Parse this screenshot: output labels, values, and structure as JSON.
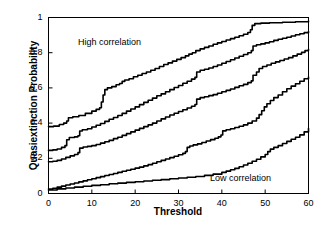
{
  "chart_data": {
    "type": "line",
    "title": "",
    "xlabel": "Threshold",
    "ylabel": "Quasiextinction Probability",
    "xlim": [
      0,
      60
    ],
    "ylim": [
      0,
      1
    ],
    "grid": false,
    "legend": "none",
    "xticks": [
      0,
      10,
      20,
      30,
      40,
      50,
      60
    ],
    "xtick_labels": [
      "0",
      "10",
      "20",
      "30",
      "40",
      "50",
      "60"
    ],
    "yticks": [
      0,
      0.2,
      0.4,
      0.6,
      0.8,
      1
    ],
    "ytick_labels": [
      "0",
      "0.2",
      "0.4",
      "0.6",
      "0.8",
      "1"
    ],
    "annotations": [
      {
        "text": "High correlation",
        "x": 10,
        "y": 0.88
      },
      {
        "text": "Low correlation",
        "x": 40,
        "y": 0.12
      }
    ],
    "line_color": "#000000",
    "line_width": 1.6,
    "series": [
      {
        "name": "curve-1",
        "points": [
          [
            0,
            0.38
          ],
          [
            1.2,
            0.383
          ],
          [
            2.5,
            0.392
          ],
          [
            3.5,
            0.4
          ],
          [
            4.2,
            0.412
          ],
          [
            4.6,
            0.43
          ],
          [
            5.6,
            0.436
          ],
          [
            7.0,
            0.443
          ],
          [
            8.5,
            0.455
          ],
          [
            10.0,
            0.468
          ],
          [
            11.0,
            0.478
          ],
          [
            11.8,
            0.487
          ],
          [
            12.2,
            0.52
          ],
          [
            12.6,
            0.56
          ],
          [
            13.0,
            0.59
          ],
          [
            13.6,
            0.6
          ],
          [
            14.6,
            0.607
          ],
          [
            15.6,
            0.618
          ],
          [
            16.4,
            0.625
          ],
          [
            17.0,
            0.637
          ],
          [
            17.6,
            0.645
          ],
          [
            18.6,
            0.652
          ],
          [
            19.6,
            0.663
          ],
          [
            20.6,
            0.672
          ],
          [
            21.6,
            0.682
          ],
          [
            22.6,
            0.69
          ],
          [
            23.6,
            0.7
          ],
          [
            24.6,
            0.71
          ],
          [
            25.6,
            0.722
          ],
          [
            26.6,
            0.733
          ],
          [
            27.6,
            0.742
          ],
          [
            28.6,
            0.752
          ],
          [
            29.6,
            0.762
          ],
          [
            30.6,
            0.772
          ],
          [
            31.6,
            0.782
          ],
          [
            32.4,
            0.792
          ],
          [
            33.2,
            0.8
          ],
          [
            34.0,
            0.812
          ],
          [
            35.0,
            0.822
          ],
          [
            36.0,
            0.83
          ],
          [
            37.0,
            0.838
          ],
          [
            38.0,
            0.848
          ],
          [
            39.0,
            0.856
          ],
          [
            40.0,
            0.864
          ],
          [
            41.0,
            0.872
          ],
          [
            42.0,
            0.88
          ],
          [
            43.0,
            0.888
          ],
          [
            44.0,
            0.896
          ],
          [
            45.0,
            0.905
          ],
          [
            46.0,
            0.915
          ],
          [
            46.6,
            0.93
          ],
          [
            47.0,
            0.955
          ],
          [
            47.6,
            0.965
          ],
          [
            49.0,
            0.968
          ],
          [
            51.0,
            0.97
          ],
          [
            54.0,
            0.973
          ],
          [
            57.0,
            0.976
          ],
          [
            60,
            0.98
          ]
        ]
      },
      {
        "name": "curve-2",
        "points": [
          [
            0,
            0.245
          ],
          [
            1.0,
            0.248
          ],
          [
            2.0,
            0.253
          ],
          [
            3.0,
            0.262
          ],
          [
            3.8,
            0.272
          ],
          [
            4.2,
            0.305
          ],
          [
            4.8,
            0.318
          ],
          [
            6.0,
            0.322
          ],
          [
            6.8,
            0.328
          ],
          [
            7.2,
            0.355
          ],
          [
            7.8,
            0.362
          ],
          [
            9.0,
            0.368
          ],
          [
            10.0,
            0.378
          ],
          [
            11.0,
            0.388
          ],
          [
            12.0,
            0.398
          ],
          [
            13.0,
            0.41
          ],
          [
            14.0,
            0.422
          ],
          [
            15.0,
            0.432
          ],
          [
            16.0,
            0.443
          ],
          [
            17.0,
            0.455
          ],
          [
            18.0,
            0.468
          ],
          [
            19.0,
            0.48
          ],
          [
            20.0,
            0.492
          ],
          [
            21.0,
            0.505
          ],
          [
            22.0,
            0.518
          ],
          [
            23.0,
            0.53
          ],
          [
            24.0,
            0.542
          ],
          [
            25.0,
            0.555
          ],
          [
            26.0,
            0.566
          ],
          [
            27.0,
            0.578
          ],
          [
            28.0,
            0.59
          ],
          [
            29.0,
            0.602
          ],
          [
            30.0,
            0.614
          ],
          [
            31.0,
            0.626
          ],
          [
            32.0,
            0.638
          ],
          [
            33.0,
            0.65
          ],
          [
            33.8,
            0.66
          ],
          [
            34.2,
            0.69
          ],
          [
            35.0,
            0.7
          ],
          [
            36.0,
            0.706
          ],
          [
            37.0,
            0.713
          ],
          [
            38.0,
            0.722
          ],
          [
            39.0,
            0.73
          ],
          [
            40.0,
            0.74
          ],
          [
            41.0,
            0.75
          ],
          [
            42.0,
            0.76
          ],
          [
            43.0,
            0.77
          ],
          [
            44.0,
            0.78
          ],
          [
            45.0,
            0.79
          ],
          [
            46.0,
            0.8
          ],
          [
            46.8,
            0.812
          ],
          [
            47.2,
            0.838
          ],
          [
            48.0,
            0.845
          ],
          [
            49.0,
            0.85
          ],
          [
            50.0,
            0.856
          ],
          [
            51.0,
            0.862
          ],
          [
            52.0,
            0.87
          ],
          [
            53.0,
            0.876
          ],
          [
            54.0,
            0.882
          ],
          [
            55.0,
            0.888
          ],
          [
            56.0,
            0.895
          ],
          [
            57.0,
            0.902
          ],
          [
            58.0,
            0.908
          ],
          [
            59.0,
            0.914
          ],
          [
            60,
            0.92
          ]
        ]
      },
      {
        "name": "curve-3",
        "points": [
          [
            0,
            0.18
          ],
          [
            1.0,
            0.183
          ],
          [
            2.0,
            0.188
          ],
          [
            3.0,
            0.196
          ],
          [
            4.0,
            0.205
          ],
          [
            5.0,
            0.214
          ],
          [
            6.0,
            0.222
          ],
          [
            6.8,
            0.232
          ],
          [
            7.2,
            0.258
          ],
          [
            8.0,
            0.264
          ],
          [
            9.0,
            0.268
          ],
          [
            10.0,
            0.272
          ],
          [
            11.0,
            0.278
          ],
          [
            12.0,
            0.286
          ],
          [
            13.0,
            0.294
          ],
          [
            14.0,
            0.302
          ],
          [
            15.0,
            0.312
          ],
          [
            16.0,
            0.32
          ],
          [
            17.0,
            0.33
          ],
          [
            18.0,
            0.34
          ],
          [
            19.0,
            0.35
          ],
          [
            20.0,
            0.36
          ],
          [
            21.0,
            0.37
          ],
          [
            22.0,
            0.38
          ],
          [
            23.0,
            0.39
          ],
          [
            24.0,
            0.4
          ],
          [
            25.0,
            0.412
          ],
          [
            26.0,
            0.424
          ],
          [
            27.0,
            0.435
          ],
          [
            28.0,
            0.446
          ],
          [
            29.0,
            0.456
          ],
          [
            30.0,
            0.466
          ],
          [
            31.0,
            0.476
          ],
          [
            32.0,
            0.486
          ],
          [
            33.0,
            0.496
          ],
          [
            33.8,
            0.506
          ],
          [
            34.2,
            0.536
          ],
          [
            35.0,
            0.545
          ],
          [
            36.0,
            0.55
          ],
          [
            37.0,
            0.556
          ],
          [
            38.0,
            0.562
          ],
          [
            39.0,
            0.57
          ],
          [
            40.0,
            0.578
          ],
          [
            41.0,
            0.586
          ],
          [
            42.0,
            0.594
          ],
          [
            43.0,
            0.603
          ],
          [
            44.0,
            0.612
          ],
          [
            45.0,
            0.62
          ],
          [
            46.0,
            0.63
          ],
          [
            46.8,
            0.64
          ],
          [
            47.2,
            0.672
          ],
          [
            48.0,
            0.69
          ],
          [
            48.6,
            0.71
          ],
          [
            49.4,
            0.722
          ],
          [
            50.4,
            0.73
          ],
          [
            51.4,
            0.74
          ],
          [
            52.4,
            0.748
          ],
          [
            53.4,
            0.756
          ],
          [
            54.4,
            0.764
          ],
          [
            55.4,
            0.772
          ],
          [
            56.4,
            0.782
          ],
          [
            57.4,
            0.792
          ],
          [
            58.4,
            0.802
          ],
          [
            59.2,
            0.812
          ],
          [
            60,
            0.82
          ]
        ]
      },
      {
        "name": "curve-4",
        "points": [
          [
            0,
            0.025
          ],
          [
            1.0,
            0.03
          ],
          [
            2.0,
            0.036
          ],
          [
            3.0,
            0.042
          ],
          [
            4.0,
            0.048
          ],
          [
            5.0,
            0.054
          ],
          [
            6.0,
            0.06
          ],
          [
            7.0,
            0.066
          ],
          [
            8.0,
            0.072
          ],
          [
            9.0,
            0.078
          ],
          [
            10.0,
            0.084
          ],
          [
            11.0,
            0.09
          ],
          [
            12.0,
            0.096
          ],
          [
            13.0,
            0.102
          ],
          [
            14.0,
            0.108
          ],
          [
            15.0,
            0.114
          ],
          [
            16.0,
            0.12
          ],
          [
            17.0,
            0.126
          ],
          [
            18.0,
            0.132
          ],
          [
            19.0,
            0.138
          ],
          [
            20.0,
            0.144
          ],
          [
            21.0,
            0.15
          ],
          [
            22.0,
            0.157
          ],
          [
            23.0,
            0.164
          ],
          [
            24.0,
            0.172
          ],
          [
            25.0,
            0.18
          ],
          [
            26.0,
            0.188
          ],
          [
            27.0,
            0.196
          ],
          [
            28.0,
            0.204
          ],
          [
            29.0,
            0.212
          ],
          [
            30.0,
            0.22
          ],
          [
            31.0,
            0.228
          ],
          [
            31.6,
            0.238
          ],
          [
            32.0,
            0.262
          ],
          [
            32.6,
            0.27
          ],
          [
            33.4,
            0.276
          ],
          [
            34.4,
            0.282
          ],
          [
            35.4,
            0.29
          ],
          [
            36.4,
            0.298
          ],
          [
            37.4,
            0.306
          ],
          [
            38.4,
            0.314
          ],
          [
            39.2,
            0.322
          ],
          [
            39.8,
            0.332
          ],
          [
            40.2,
            0.356
          ],
          [
            41.0,
            0.362
          ],
          [
            42.0,
            0.368
          ],
          [
            43.0,
            0.375
          ],
          [
            44.0,
            0.382
          ],
          [
            45.0,
            0.39
          ],
          [
            46.0,
            0.4
          ],
          [
            47.0,
            0.412
          ],
          [
            48.0,
            0.428
          ],
          [
            48.6,
            0.448
          ],
          [
            49.2,
            0.47
          ],
          [
            49.8,
            0.492
          ],
          [
            50.4,
            0.51
          ],
          [
            51.2,
            0.528
          ],
          [
            52.0,
            0.545
          ],
          [
            53.0,
            0.56
          ],
          [
            54.0,
            0.578
          ],
          [
            55.0,
            0.595
          ],
          [
            56.0,
            0.61
          ],
          [
            57.0,
            0.624
          ],
          [
            58.0,
            0.638
          ],
          [
            59.0,
            0.652
          ],
          [
            60,
            0.662
          ]
        ]
      },
      {
        "name": "curve-5",
        "points": [
          [
            0,
            0.02
          ],
          [
            2.0,
            0.026
          ],
          [
            4.0,
            0.031
          ],
          [
            6.0,
            0.036
          ],
          [
            8.0,
            0.041
          ],
          [
            10.0,
            0.046
          ],
          [
            12.0,
            0.05
          ],
          [
            14.0,
            0.055
          ],
          [
            16.0,
            0.059
          ],
          [
            18.0,
            0.063
          ],
          [
            20.0,
            0.067
          ],
          [
            22.0,
            0.071
          ],
          [
            24.0,
            0.075
          ],
          [
            26.0,
            0.079
          ],
          [
            28.0,
            0.084
          ],
          [
            30.0,
            0.088
          ],
          [
            32.0,
            0.092
          ],
          [
            34.0,
            0.097
          ],
          [
            36.0,
            0.103
          ],
          [
            38.0,
            0.11
          ],
          [
            40.0,
            0.12
          ],
          [
            41.0,
            0.127
          ],
          [
            42.0,
            0.135
          ],
          [
            43.0,
            0.143
          ],
          [
            44.0,
            0.152
          ],
          [
            45.0,
            0.162
          ],
          [
            46.0,
            0.172
          ],
          [
            47.0,
            0.183
          ],
          [
            48.0,
            0.195
          ],
          [
            49.0,
            0.208
          ],
          [
            50.0,
            0.222
          ],
          [
            50.6,
            0.238
          ],
          [
            51.2,
            0.252
          ],
          [
            52.0,
            0.262
          ],
          [
            53.0,
            0.272
          ],
          [
            54.0,
            0.284
          ],
          [
            55.0,
            0.296
          ],
          [
            56.0,
            0.308
          ],
          [
            57.0,
            0.32
          ],
          [
            58.0,
            0.333
          ],
          [
            59.0,
            0.35
          ],
          [
            60,
            0.37
          ]
        ]
      }
    ]
  },
  "axes": {
    "frame_color": "#000000",
    "background": "#ffffff"
  }
}
